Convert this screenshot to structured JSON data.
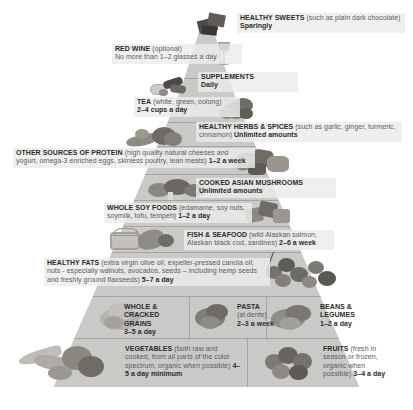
{
  "poster": {
    "title": "Anti-Inflammatory Food Pyramid",
    "background_color": "#ffffff",
    "tier_color": "#c9c9c7",
    "label_bg": "#ececea",
    "heading_color": "#2c2c2c",
    "body_color": "#5c5c5c"
  },
  "tiers": [
    {
      "id": "healthy-sweets",
      "heading": "HEALTHY SWEETS",
      "body": "(such as plain dark chocolate)",
      "amount": "Sparingly",
      "align": "left",
      "food_icon": "dark-chocolate-squares"
    },
    {
      "id": "red-wine",
      "heading": "RED WINE",
      "body": "(optional)",
      "amount": "No more than 1–2 glasses a day",
      "align": "left",
      "food_icon": "wine-glass"
    },
    {
      "id": "supplements",
      "heading": "SUPPLEMENTS",
      "body": "",
      "amount": "Daily",
      "align": "left",
      "food_icon": "supplement-capsules"
    },
    {
      "id": "tea",
      "heading": "TEA",
      "body": "(white, green, oolong)",
      "amount": "2–4 cups a day",
      "align": "left",
      "food_icon": "loose-tea-leaves"
    },
    {
      "id": "healthy-herbs-spices",
      "heading": "HEALTHY HERBS & SPICES",
      "body": "(such as garlic, ginger, turmeric, cinnamon)",
      "amount": "Unlimited amounts",
      "align": "left",
      "food_icon": "ginger-root-and-herbs"
    },
    {
      "id": "other-sources-of-protein",
      "heading": "OTHER SOURCES OF PROTEIN",
      "body": "(high quality natural cheeses and yogurt, omega-3 enriched eggs, skinless poultry, lean meats)",
      "amount": "1–2 a week",
      "align": "left",
      "food_icon": "cheese-and-egg"
    },
    {
      "id": "cooked-asian-mushrooms",
      "heading": "COOKED ASIAN MUSHROOMS",
      "body": "",
      "amount": "Unlimited amounts",
      "align": "left",
      "food_icon": "shiitake-mushrooms"
    },
    {
      "id": "whole-soy-foods",
      "heading": "WHOLE SOY FOODS",
      "body": "(edamame, soy nuts, soymilk, tofu, tempeh)",
      "amount": "1–2 a day",
      "align": "left",
      "food_icon": "tofu-cubes"
    },
    {
      "id": "fish-and-seafood",
      "heading": "FISH & SEAFOOD",
      "body": "(wild Alaskan salmon, Alaskan black cod, sardines)",
      "amount": "2–6 a week",
      "align": "left",
      "food_icon": "fish-fillet-and-sardine-tin"
    },
    {
      "id": "healthy-fats",
      "heading": "HEALTHY FATS",
      "body": "(extra virgin olive oil, expeller-pressed canola oil, nuts - especially walnuts, avocados, seeds – including hemp seeds and freshly ground flaxseeds)",
      "amount": "5–7 a day",
      "align": "left",
      "food_icon": "walnuts-and-olives"
    }
  ],
  "grains_row": [
    {
      "id": "whole-cracked-grains",
      "heading": "WHOLE & CRACKED GRAINS",
      "body": "",
      "amount": "3–5 a day",
      "food_icon": "cracked-grains"
    },
    {
      "id": "pasta",
      "heading": "PASTA",
      "body": "(al dente)",
      "amount": "2–3 a week",
      "food_icon": "cooked-pasta"
    },
    {
      "id": "beans-legumes",
      "heading": "BEANS & LEGUMES",
      "body": "",
      "amount": "1–2 a day",
      "food_icon": "mixed-beans"
    }
  ],
  "base_row": [
    {
      "id": "vegetables",
      "heading": "VEGETABLES",
      "body": "(both raw and cooked, from all parts of the color spectrum, organic when possible)",
      "amount": "4–5 a day minimum",
      "food_icon": "assorted-vegetables"
    },
    {
      "id": "fruits",
      "heading": "FRUITS",
      "body": "(fresh in season or frozen, organic when possible)",
      "amount": "3–4  a day",
      "food_icon": "berries-and-grapes"
    }
  ]
}
